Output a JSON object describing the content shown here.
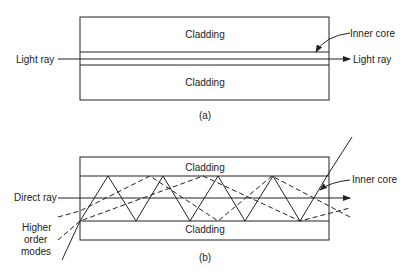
{
  "figure_a": {
    "cladding_top": "Cladding",
    "cladding_bottom": "Cladding",
    "inner_core": "Inner core",
    "light_ray_in": "Light ray",
    "light_ray_out": "Light ray",
    "caption": "(a)"
  },
  "figure_b": {
    "cladding_top": "Cladding",
    "cladding_bottom": "Cladding",
    "inner_core": "Inner core",
    "direct_ray": "Direct ray",
    "higher_order_1": "Higher",
    "higher_order_2": "order",
    "higher_order_3": "modes",
    "caption": "(b)"
  }
}
